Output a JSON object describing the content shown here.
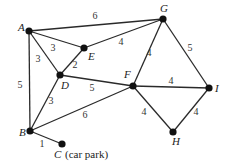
{
  "nodes": [
    {
      "id": "A",
      "label": "A",
      "x": 29,
      "y": 31,
      "lx": 18,
      "ly": 31
    },
    {
      "id": "G",
      "label": "G",
      "x": 163,
      "y": 19,
      "lx": 160,
      "ly": 12
    },
    {
      "id": "E",
      "label": "E",
      "x": 84,
      "y": 48,
      "lx": 88,
      "ly": 60
    },
    {
      "id": "D",
      "label": "D",
      "x": 60,
      "y": 75,
      "lx": 61,
      "ly": 89
    },
    {
      "id": "F",
      "label": "F",
      "x": 133,
      "y": 86,
      "lx": 124,
      "ly": 78
    },
    {
      "id": "I",
      "label": "I",
      "x": 209,
      "y": 88,
      "lx": 215,
      "ly": 92
    },
    {
      "id": "H",
      "label": "H",
      "x": 173,
      "y": 132,
      "lx": 172,
      "ly": 145
    },
    {
      "id": "B",
      "label": "B",
      "x": 30,
      "y": 131,
      "lx": 19,
      "ly": 136
    },
    {
      "id": "C",
      "label": "C",
      "x": 62,
      "y": 144,
      "lx": 54,
      "ly": 158
    }
  ],
  "edges": [
    {
      "from": "A",
      "to": "G",
      "weight": "6",
      "wx": 95,
      "wy": 19
    },
    {
      "from": "A",
      "to": "E",
      "weight": "3",
      "wx": 53,
      "wy": 51
    },
    {
      "from": "A",
      "to": "D",
      "weight": "3",
      "wx": 38,
      "wy": 62
    },
    {
      "from": "A",
      "to": "B",
      "weight": "5",
      "wx": 20,
      "wy": 88
    },
    {
      "from": "E",
      "to": "G",
      "weight": "4",
      "wx": 121,
      "wy": 45
    },
    {
      "from": "E",
      "to": "D",
      "weight": "2",
      "wx": 75,
      "wy": 68
    },
    {
      "from": "D",
      "to": "F",
      "weight": "5",
      "wx": 92,
      "wy": 91
    },
    {
      "from": "D",
      "to": "B",
      "weight": "3",
      "wx": 51,
      "wy": 104
    },
    {
      "from": "G",
      "to": "F",
      "weight": "4",
      "wx": 149,
      "wy": 56
    },
    {
      "from": "G",
      "to": "I",
      "weight": "5",
      "wx": 190,
      "wy": 51
    },
    {
      "from": "F",
      "to": "I",
      "weight": "4",
      "wx": 171,
      "wy": 84
    },
    {
      "from": "F",
      "to": "B",
      "weight": "6",
      "wx": 85,
      "wy": 118
    },
    {
      "from": "F",
      "to": "H",
      "weight": "4",
      "wx": 144,
      "wy": 115
    },
    {
      "from": "I",
      "to": "H",
      "weight": "4",
      "wx": 196,
      "wy": 115
    },
    {
      "from": "B",
      "to": "C",
      "weight": "1",
      "wx": 42,
      "wy": 147
    }
  ],
  "car_park_label": "(car park)"
}
